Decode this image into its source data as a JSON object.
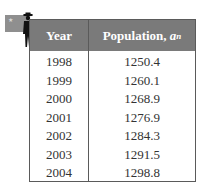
{
  "table": {
    "headers": {
      "year": "Year",
      "population_prefix": "Population, ",
      "population_var": "a",
      "population_sub": "n"
    },
    "rows": [
      {
        "year": "1998",
        "population": "1250.4"
      },
      {
        "year": "1999",
        "population": "1260.1"
      },
      {
        "year": "2000",
        "population": "1268.9"
      },
      {
        "year": "2001",
        "population": "1276.9"
      },
      {
        "year": "2002",
        "population": "1284.3"
      },
      {
        "year": "2003",
        "population": "1291.5"
      },
      {
        "year": "2004",
        "population": "1298.8"
      }
    ]
  },
  "icons": {
    "flag": "flag-icon",
    "person": "person-silhouette-icon"
  },
  "colors": {
    "header_bg": "#7a7a7a",
    "header_text": "#ffffff",
    "border": "#5a5a5a",
    "body_text": "#333333"
  }
}
